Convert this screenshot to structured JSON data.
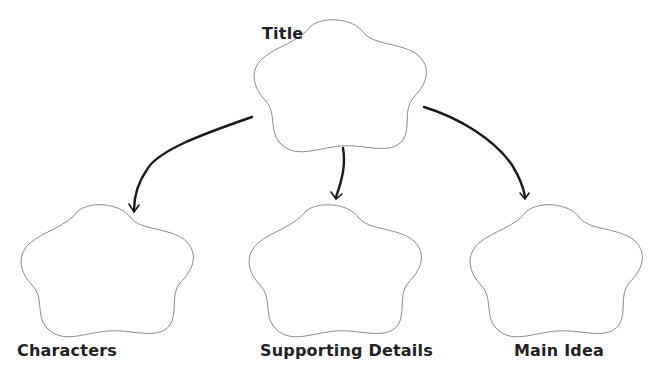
{
  "diagram": {
    "type": "graphic-organizer",
    "nodes": [
      {
        "id": "title",
        "label": "Title",
        "shape": "cloud"
      },
      {
        "id": "characters",
        "label": "Characters",
        "shape": "cloud"
      },
      {
        "id": "supporting_details",
        "label": "Supporting Details",
        "shape": "cloud"
      },
      {
        "id": "main_idea",
        "label": "Main Idea",
        "shape": "cloud"
      }
    ],
    "edges": [
      {
        "from": "title",
        "to": "characters"
      },
      {
        "from": "title",
        "to": "supporting_details"
      },
      {
        "from": "title",
        "to": "main_idea"
      }
    ],
    "colors": {
      "cloud_stroke": "#8a8a8a",
      "arrow": "#1a1a1a",
      "text": "#222222",
      "background": "#ffffff"
    }
  },
  "labels": {
    "title": "Title",
    "characters": "Characters",
    "supporting_details": "Supporting Details",
    "main_idea": "Main Idea"
  }
}
